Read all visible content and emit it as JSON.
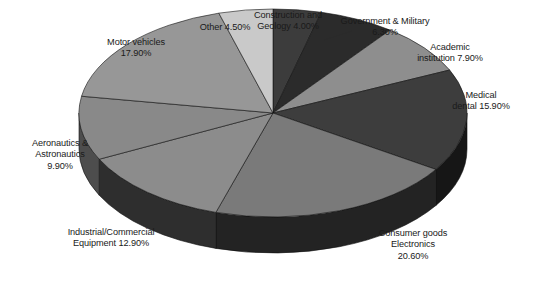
{
  "chart_data": {
    "type": "pie",
    "title": "",
    "subtitle": "",
    "xlabel": "",
    "ylabel": "",
    "legend_position": "none",
    "grid": false,
    "style": "3d-pie",
    "value_unit": "percent",
    "categories": [
      "Construction and Geology",
      "Government & Military",
      "Academic institution",
      "Medical dental",
      "Consumer goods Electronics",
      "Industrial/Commercial Equipment",
      "Aeronautics & Astronautics",
      "Motor vehicles",
      "Other"
    ],
    "values": [
      4.0,
      6.3,
      7.9,
      15.9,
      20.6,
      12.9,
      9.9,
      17.9,
      4.5
    ],
    "slices": [
      {
        "name": "Construction and Geology",
        "value": 4.0,
        "label": "Construction and\nGeology 4.00%",
        "color": "#3c3c3c",
        "side_color": "#242424"
      },
      {
        "name": "Government & Military",
        "value": 6.3,
        "label": "Government & Military\n6.30%",
        "color": "#2b2b2b",
        "side_color": "#1a1a1a"
      },
      {
        "name": "Academic institution",
        "value": 7.9,
        "label": "Academic\ninstitution 7.90%",
        "color": "#8e8e8e",
        "side_color": "#5a5a5a"
      },
      {
        "name": "Medical dental",
        "value": 15.9,
        "label": "Medical\ndental 15.90%",
        "color": "#3d3d3d",
        "side_color": "#161616"
      },
      {
        "name": "Consumer goods Electronics",
        "value": 20.6,
        "label": "Consumer goods\nElectronics\n20.60%",
        "color": "#7a7a7a",
        "side_color": "#232323"
      },
      {
        "name": "Industrial/Commercial Equipment",
        "value": 12.9,
        "label": "Industrial/Commercial\nEquipment 12.90%",
        "color": "#8c8c8c",
        "side_color": "#2e2e2e"
      },
      {
        "name": "Aeronautics & Astronautics",
        "value": 9.9,
        "label": "Aeronautics &\nAstronautics\n9.90%",
        "color": "#898989",
        "side_color": "#4d4d4d"
      },
      {
        "name": "Motor vehicles",
        "value": 17.9,
        "label": "Motor vehicles\n17.90%",
        "color": "#979797",
        "side_color": "#606060"
      },
      {
        "name": "Other",
        "value": 4.5,
        "label": "Other 4.50%",
        "color": "#c9c9c9",
        "side_color": "#8f8f8f"
      }
    ]
  },
  "labels": {
    "other": "Other 4.50%",
    "construction": "Construction and\nGeology 4.00%",
    "government": "Government & Military\n6.30%",
    "academic": "Academic\ninstitution 7.90%",
    "medical": "Medical\ndental 15.90%",
    "consumer": "Consumer goods\nElectronics\n20.60%",
    "industrial": "Industrial/Commercial\nEquipment 12.90%",
    "aeronautics": "Aeronautics &\nAstronautics\n9.90%",
    "motor": "Motor vehicles\n17.90%"
  }
}
